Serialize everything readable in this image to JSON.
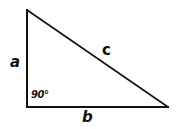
{
  "diagram": {
    "type": "right-triangle",
    "stroke_color": "#111111",
    "background": "#ffffff",
    "vertices": {
      "top": [
        27,
        10
      ],
      "right_angle": [
        27,
        107
      ],
      "right": [
        168,
        107
      ]
    },
    "sides": {
      "vertical": {
        "label": "a"
      },
      "horizontal": {
        "label": "b"
      },
      "hypotenuse": {
        "label": "c"
      }
    },
    "angle": {
      "label": "90°"
    }
  }
}
